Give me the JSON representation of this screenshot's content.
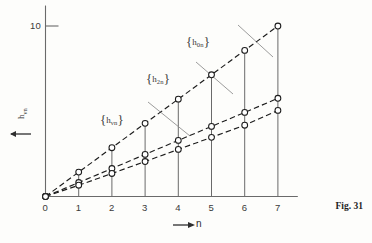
{
  "figure": {
    "caption": "Fig. 31"
  },
  "axes": {
    "y": {
      "label_main": "h",
      "label_sub": "νn",
      "arrow_icon": "left-arrow-icon",
      "ticks": [
        {
          "value": 10,
          "label": "10"
        }
      ]
    },
    "x": {
      "label": "n",
      "arrow_icon": "right-arrow-icon",
      "ticks": [
        {
          "value": 0,
          "label": "0"
        },
        {
          "value": 1,
          "label": "1"
        },
        {
          "value": 2,
          "label": "2"
        },
        {
          "value": 3,
          "label": "3"
        },
        {
          "value": 4,
          "label": "4"
        },
        {
          "value": 5,
          "label": "5"
        },
        {
          "value": 6,
          "label": "6"
        },
        {
          "value": 7,
          "label": "7"
        }
      ]
    }
  },
  "series_labels": [
    {
      "name": "h0n",
      "main": "h",
      "sub": "0n",
      "x": 186,
      "y": 34
    },
    {
      "name": "h2n",
      "main": "h",
      "sub": "2n",
      "x": 146,
      "y": 71
    },
    {
      "name": "hvn",
      "main": "h",
      "sub": "νn",
      "x": 100,
      "y": 112
    }
  ],
  "colors": {
    "axis": "#6a6a6a",
    "curve": "#1c1c1c",
    "marker_stroke": "#1c1c1c",
    "marker_fill": "#ffffff",
    "leader": "#8a8a8a",
    "background": "#fdfdfb",
    "text": "#2e2e2e"
  },
  "chart_data": {
    "type": "line",
    "title": "Fig. 31",
    "xlabel": "n",
    "ylabel": "h_νn",
    "xlim": [
      0,
      7.6
    ],
    "ylim": [
      0,
      11.2
    ],
    "xticks": [
      0,
      1,
      2,
      3,
      4,
      5,
      6,
      7
    ],
    "yticks": [
      10
    ],
    "grid": false,
    "legend": "inline-annotations",
    "linestyle": "dashed",
    "marker": "open-circle",
    "x": [
      0,
      1,
      2,
      3,
      4,
      5,
      6,
      7
    ],
    "series": [
      {
        "name": "{h_0n}",
        "values": [
          0,
          1.43,
          2.86,
          4.29,
          5.71,
          7.14,
          8.57,
          10.0
        ]
      },
      {
        "name": "{h_2n}",
        "values": [
          0,
          0.82,
          1.64,
          2.47,
          3.29,
          4.11,
          4.93,
          5.76
        ]
      },
      {
        "name": "{h_νn}",
        "values": [
          0,
          0.66,
          1.35,
          2.05,
          2.76,
          3.47,
          4.18,
          5.05
        ]
      }
    ],
    "vertical_connectors": "At each integer n = 1..7 a vertical line joins the x-axis up through all three series markers",
    "annotations": [
      {
        "text": "{h_0n}",
        "points_to_series": "{h_0n}",
        "near_x": 5
      },
      {
        "text": "{h_2n}",
        "points_to_series": "{h_2n}",
        "near_x": 4
      },
      {
        "text": "{h_νn}",
        "points_to_series": "{h_νn}",
        "near_x": 3
      }
    ]
  }
}
